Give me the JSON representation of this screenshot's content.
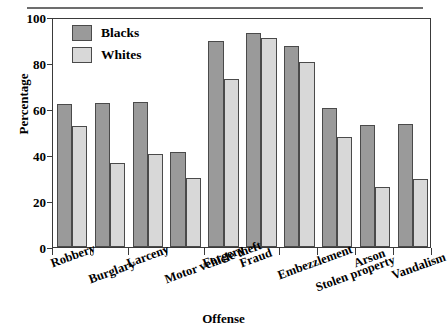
{
  "chart_data": {
    "type": "bar",
    "title": "",
    "xlabel": "Offense",
    "ylabel": "Percentage",
    "ylim": [
      0,
      100
    ],
    "yticks": [
      0,
      20,
      40,
      60,
      80,
      100
    ],
    "grid": false,
    "legend_position": "top-left",
    "categories": [
      "Robbery",
      "Burglary",
      "Larceny",
      "Motor vehicle theft",
      "Forgery",
      "Fraud",
      "Embezzlement",
      "Stolen property",
      "Arson",
      "Vandalism"
    ],
    "series": [
      {
        "name": "Blacks",
        "color": "#9a9a9a",
        "values": [
          62,
          62.5,
          63,
          41.5,
          89.5,
          93,
          87.5,
          60.5,
          53,
          53.5
        ]
      },
      {
        "name": "Whites",
        "color": "#d8d8d8",
        "values": [
          52.5,
          36.5,
          40.5,
          30,
          73,
          91,
          80.5,
          48,
          26,
          29.5
        ]
      }
    ]
  },
  "legend": {
    "items": [
      {
        "label": "Blacks",
        "swatch": "blacks"
      },
      {
        "label": "Whites",
        "swatch": "whites"
      }
    ]
  },
  "axes": {
    "y_title": "Percentage",
    "x_title": "Offense",
    "y_tick_labels": [
      "0",
      "20",
      "40",
      "60",
      "80",
      "100"
    ]
  }
}
